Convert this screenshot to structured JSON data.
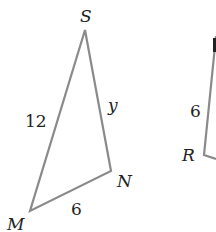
{
  "figure": {
    "triangle_1": {
      "vertices": {
        "S": {
          "label": "S",
          "x": 85,
          "y": 30
        },
        "N": {
          "label": "N",
          "x": 111,
          "y": 171
        },
        "M": {
          "label": "M",
          "x": 30,
          "y": 211
        }
      },
      "sides": {
        "SM": "12",
        "SN": "y",
        "MN": "6"
      }
    },
    "triangle_2": {
      "vertices": {
        "R": {
          "label": "R"
        }
      },
      "sides": {
        "side_at_R": "6"
      }
    },
    "stroke_color": "#8a8a8a",
    "label_color": "#222222"
  }
}
